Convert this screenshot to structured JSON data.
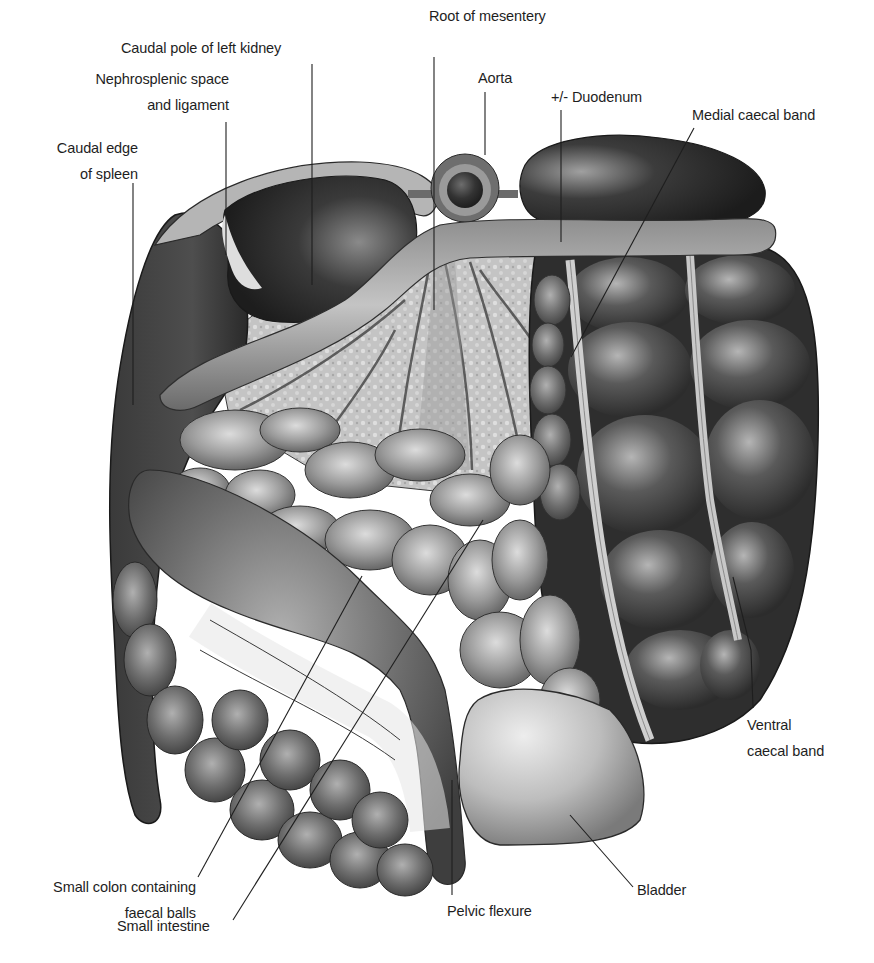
{
  "figure": {
    "background": "#ffffff",
    "ink": "#1e1e1e"
  },
  "labels": {
    "caudal_pole_left_kidney": {
      "lines": [
        "Caudal pole of left kidney"
      ]
    },
    "nephrosplenic": {
      "lines": [
        "Nephrosplenic space",
        "and ligament"
      ]
    },
    "caudal_edge_spleen": {
      "lines": [
        "Caudal edge",
        "of spleen"
      ]
    },
    "root_of_mesentery": {
      "lines": [
        "Root of mesentery"
      ]
    },
    "aorta": {
      "lines": [
        "Aorta"
      ]
    },
    "duodenum": {
      "lines": [
        "+/- Duodenum"
      ]
    },
    "medial_caecal_band": {
      "lines": [
        "Medial caecal band"
      ]
    },
    "ventral_caecal_band": {
      "lines": [
        "Ventral",
        "caecal band"
      ]
    },
    "bladder": {
      "lines": [
        "Bladder"
      ]
    },
    "pelvic_flexure": {
      "lines": [
        "Pelvic flexure"
      ]
    },
    "small_intestine": {
      "lines": [
        "Small intestine"
      ]
    },
    "small_colon": {
      "lines": [
        "Small colon containing",
        "faecal balls"
      ]
    }
  },
  "colors": {
    "organ_dark": "#2b2b2b",
    "organ_mid": "#5e5e5e",
    "organ_light": "#9a9a9a",
    "mesentery": "#c9c9c9",
    "bladder": "#bdbdbd",
    "outline": "#1a1a1a"
  }
}
